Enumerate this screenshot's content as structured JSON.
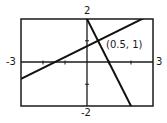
{
  "chart_data": {
    "type": "line",
    "title": "",
    "xlabel": "",
    "ylabel": "",
    "xlim": [
      -3,
      3
    ],
    "ylim": [
      -2,
      2
    ],
    "grid": false,
    "tick_labels": {
      "x_min": "-3",
      "x_max": "3",
      "y_max": "2",
      "y_min": "-2"
    },
    "series": [
      {
        "name": "line-1",
        "slope": 0.5,
        "intercept": 0.75,
        "x": [
          -3,
          3
        ],
        "y": [
          -0.75,
          2.25
        ]
      },
      {
        "name": "line-2",
        "slope": -2,
        "intercept": 2,
        "x": [
          -0.25,
          2.5
        ],
        "y": [
          2.5,
          -3
        ]
      }
    ],
    "annotations": [
      {
        "text": "(0.5, 1)",
        "x": 0.5,
        "y": 1
      }
    ]
  },
  "labels": {
    "y_top": "2",
    "y_bottom": "-2",
    "x_left": "-3",
    "x_right": "3",
    "point": "(0.5, 1)"
  }
}
